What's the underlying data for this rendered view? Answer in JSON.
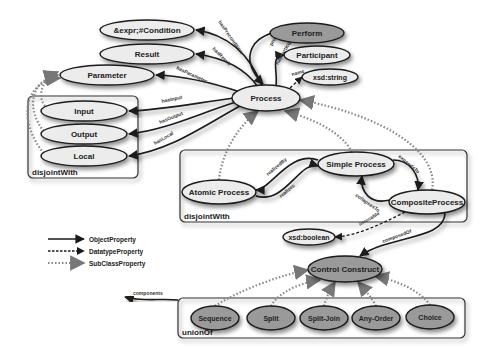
{
  "diagram": {
    "colors": {
      "node_light": "#ececec",
      "node_dark": "#9a9a9a",
      "stroke": "#1a1a1a",
      "background": "#ffffff"
    },
    "nodes": [
      {
        "id": "condition",
        "label": "&expr;#Condition",
        "cx": 147,
        "cy": 30,
        "rx": 47,
        "ry": 10,
        "style": "light"
      },
      {
        "id": "result",
        "label": "Result",
        "cx": 147,
        "cy": 54,
        "rx": 47,
        "ry": 10,
        "style": "light"
      },
      {
        "id": "parameter",
        "label": "Parameter",
        "cx": 107,
        "cy": 75,
        "rx": 47,
        "ry": 10,
        "style": "light"
      },
      {
        "id": "input",
        "label": "Input",
        "cx": 84,
        "cy": 111,
        "rx": 43,
        "ry": 10,
        "style": "light"
      },
      {
        "id": "output",
        "label": "Output",
        "cx": 84,
        "cy": 134,
        "rx": 43,
        "ry": 10,
        "style": "light"
      },
      {
        "id": "local",
        "label": "Local",
        "cx": 84,
        "cy": 156,
        "rx": 43,
        "ry": 10,
        "style": "light"
      },
      {
        "id": "perform",
        "label": "Perform",
        "cx": 307,
        "cy": 33,
        "rx": 37,
        "ry": 10,
        "style": "dark"
      },
      {
        "id": "participant",
        "label": "Participant",
        "cx": 317,
        "cy": 55,
        "rx": 33,
        "ry": 9,
        "style": "light"
      },
      {
        "id": "xsd_string",
        "label": "xsd:string",
        "cx": 330,
        "cy": 77,
        "rx": 28,
        "ry": 8,
        "style": "light"
      },
      {
        "id": "process",
        "label": "Process",
        "cx": 266,
        "cy": 98,
        "rx": 34,
        "ry": 13,
        "style": "light"
      },
      {
        "id": "atomic_process",
        "label": "Atomic Process",
        "cx": 219,
        "cy": 192,
        "rx": 37,
        "ry": 12,
        "style": "light"
      },
      {
        "id": "simple_process",
        "label": "Simple Process",
        "cx": 356,
        "cy": 164,
        "rx": 38,
        "ry": 12,
        "style": "light"
      },
      {
        "id": "composite_process",
        "label": "CompositeProcess",
        "cx": 427,
        "cy": 202,
        "rx": 38,
        "ry": 12,
        "style": "light"
      },
      {
        "id": "xsd_boolean",
        "label": "xsd:boolean",
        "cx": 309,
        "cy": 237,
        "rx": 26,
        "ry": 8,
        "style": "light"
      },
      {
        "id": "control_construct",
        "label": "Control Construct",
        "cx": 345,
        "cy": 269,
        "rx": 37,
        "ry": 13,
        "style": "dark"
      },
      {
        "id": "sequence",
        "label": "Sequence",
        "cx": 215,
        "cy": 318,
        "rx": 24,
        "ry": 12,
        "style": "dark"
      },
      {
        "id": "split",
        "label": "Split",
        "cx": 271,
        "cy": 318,
        "rx": 24,
        "ry": 12,
        "style": "dark"
      },
      {
        "id": "split_join",
        "label": "Split-Join",
        "cx": 324,
        "cy": 318,
        "rx": 24,
        "ry": 12,
        "style": "dark"
      },
      {
        "id": "any_order",
        "label": "Any-Order",
        "cx": 376,
        "cy": 318,
        "rx": 24,
        "ry": 12,
        "style": "dark"
      },
      {
        "id": "choice",
        "label": "Choice",
        "cx": 430,
        "cy": 317,
        "rx": 24,
        "ry": 12,
        "style": "dark"
      }
    ],
    "groups": [
      {
        "id": "io_group",
        "label": "disjointWith",
        "x": 28,
        "y": 96,
        "w": 110,
        "h": 82
      },
      {
        "id": "process_group",
        "label": "disjointWith",
        "x": 180,
        "y": 150,
        "w": 287,
        "h": 72
      },
      {
        "id": "construct_group",
        "label": "unionOf",
        "x": 178,
        "y": 298,
        "w": 287,
        "h": 40
      }
    ],
    "edges": [
      {
        "label": "hasPrecondition",
        "type": "object",
        "path": "M262,86 C250,55 230,35 196,30",
        "lx": 218,
        "ly": 22,
        "rot": 55
      },
      {
        "label": "hasResult",
        "type": "object",
        "path": "M258,87 C245,68 225,58 196,54",
        "lx": 212,
        "ly": 49,
        "rot": 45
      },
      {
        "label": "hasParameter",
        "type": "object",
        "path": "M240,92 C210,82 185,76 156,75",
        "lx": 176,
        "ly": 69,
        "rot": 25
      },
      {
        "label": "hasInput",
        "type": "object",
        "path": "M234,98 C190,104 160,110 129,111",
        "lx": 162,
        "ly": 103,
        "rot": -12
      },
      {
        "label": "hasOutput",
        "type": "object",
        "path": "M236,102 C195,115 165,130 129,134",
        "lx": 160,
        "ly": 124,
        "rot": -22
      },
      {
        "label": "hasLocal",
        "type": "object",
        "path": "M240,106 C200,128 170,150 129,156",
        "lx": 155,
        "ly": 145,
        "rot": -30
      },
      {
        "label": "process",
        "type": "object",
        "path": "M272,33 C250,40 240,60 263,84",
        "lx": 272,
        "ly": 46,
        "rot": -60
      },
      {
        "label": "hasParticipant",
        "type": "object",
        "path": "M276,86 C278,70 270,56 284,55",
        "lx": 278,
        "ly": 65,
        "rot": -60
      },
      {
        "label": "name",
        "type": "datatype",
        "path": "M290,88 L302,77",
        "lx": 292,
        "ly": 76,
        "rot": -15
      },
      {
        "label": "realizedBy",
        "type": "object",
        "path": "M318,160 C290,150 270,190 256,190",
        "lx": 268,
        "ly": 176,
        "rot": -40
      },
      {
        "label": "realizes",
        "type": "object",
        "path": "M256,196 C285,205 300,160 318,166",
        "lx": 281,
        "ly": 198,
        "rot": -40
      },
      {
        "label": "expandsTo",
        "type": "object",
        "path": "M393,160 C410,160 420,175 418,190",
        "lx": 398,
        "ly": 157,
        "rot": 40
      },
      {
        "label": "collapsesTo",
        "type": "object",
        "path": "M390,200 C370,205 360,192 362,176",
        "lx": 355,
        "ly": 196,
        "rot": 35
      },
      {
        "label": "invocable",
        "type": "datatype",
        "path": "M405,212 C380,225 355,236 335,237",
        "lx": 360,
        "ly": 226,
        "rot": -30
      },
      {
        "label": "composedOf",
        "type": "object",
        "path": "M445,213 C445,240 390,235 360,256",
        "lx": 383,
        "ly": 243,
        "rot": -20
      },
      {
        "label": "components",
        "type": "object",
        "path": "M178,300 C160,298 145,302 125,297",
        "lx": 133,
        "ly": 295,
        "rot": 0
      }
    ],
    "subclass_edges": [
      {
        "path": "M219,180 C222,150 240,125 258,111"
      },
      {
        "path": "M352,152 C340,130 310,118 285,111"
      },
      {
        "path": "M432,190 C440,150 380,115 300,100"
      },
      {
        "path": "M50,111 C35,100 40,80 58,72"
      },
      {
        "path": "M46,134 C25,110 30,80 58,75"
      },
      {
        "path": "M46,156 C15,120 25,80 60,78"
      },
      {
        "path": "M215,306 C240,290 280,275 308,270"
      },
      {
        "path": "M271,306 C280,290 305,282 320,280"
      },
      {
        "path": "M324,306 C326,298 330,290 335,282"
      },
      {
        "path": "M376,306 C372,298 365,290 358,282"
      },
      {
        "path": "M430,305 C420,290 395,280 375,276"
      }
    ],
    "legend": [
      {
        "label": "ObjectProperty",
        "type": "object",
        "y": 239
      },
      {
        "label": "DatatypeProperty",
        "type": "datatype",
        "y": 251
      },
      {
        "label": "SubClassProperty",
        "type": "subclass",
        "y": 263
      }
    ]
  }
}
